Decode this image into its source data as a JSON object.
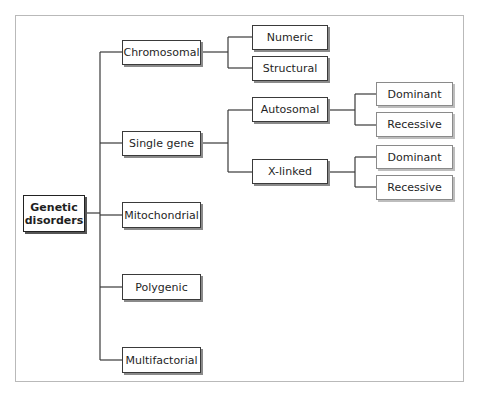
{
  "diagram": {
    "type": "tree",
    "root": {
      "label_line1": "Genetic",
      "label_line2": "disorders"
    },
    "categories": [
      {
        "label": "Chromosomal",
        "children": [
          {
            "label": "Numeric"
          },
          {
            "label": "Structural"
          }
        ]
      },
      {
        "label": "Single gene",
        "children": [
          {
            "label": "Autosomal",
            "children": [
              {
                "label": "Dominant"
              },
              {
                "label": "Recessive"
              }
            ]
          },
          {
            "label": "X-linked",
            "children": [
              {
                "label": "Dominant"
              },
              {
                "label": "Recessive"
              }
            ]
          }
        ]
      },
      {
        "label": "Mitochondrial"
      },
      {
        "label": "Polygenic"
      },
      {
        "label": "Multifactorial"
      }
    ]
  },
  "colors": {
    "line": "#3a3a3a",
    "frame": "#b9b9b9",
    "shadow": "#8a8a8a"
  }
}
